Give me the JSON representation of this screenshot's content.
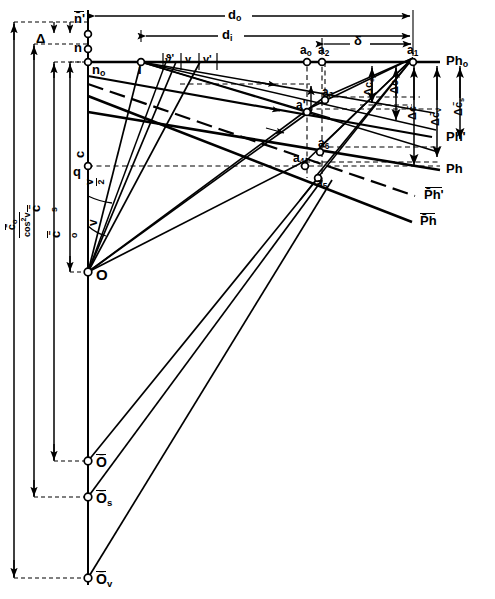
{
  "figure": {
    "type": "technical-geometry-diagram",
    "domain": "photogrammetry-optics-ray-construction",
    "background": "#ffffff",
    "ink": "#000000"
  },
  "points": [
    {
      "id": "n_bar_prime",
      "label": "n̄'",
      "x": 88,
      "y": 34
    },
    {
      "id": "n",
      "label": "n",
      "x": 88,
      "y": 49
    },
    {
      "id": "n0",
      "label": "n₀",
      "x": 88,
      "y": 62
    },
    {
      "id": "i",
      "label": "i",
      "x": 141,
      "y": 62
    },
    {
      "id": "q",
      "label": "q",
      "x": 88,
      "y": 166
    },
    {
      "id": "O",
      "label": "O",
      "x": 88,
      "y": 272
    },
    {
      "id": "O_bar",
      "label": "Ō",
      "x": 88,
      "y": 461
    },
    {
      "id": "O_bar_s",
      "label": "Ō_s",
      "x": 88,
      "y": 497
    },
    {
      "id": "O_bar_v",
      "label": "Ō_v",
      "x": 88,
      "y": 578
    },
    {
      "id": "a0",
      "label": "a₀",
      "x": 307,
      "y": 58
    },
    {
      "id": "a2",
      "label": "a₂",
      "x": 322,
      "y": 58
    },
    {
      "id": "a1",
      "label": "a₁",
      "x": 413,
      "y": 58
    },
    {
      "id": "a3",
      "label": "a₃",
      "x": 325,
      "y": 97
    },
    {
      "id": "a_prime",
      "label": "a'",
      "x": 308,
      "y": 109
    },
    {
      "id": "a6",
      "label": "a₆",
      "x": 320,
      "y": 147
    },
    {
      "id": "a4",
      "label": "a₄",
      "x": 305,
      "y": 162
    },
    {
      "id": "a5",
      "label": "a₅",
      "x": 317,
      "y": 175
    }
  ],
  "labels": {
    "n_bar_prime": "n̄'",
    "n": "n",
    "n0": "n",
    "n0_sub": "o",
    "i": "i",
    "q": "q",
    "O": "O",
    "O_bar": "Ō",
    "O_bar_s": "Ō",
    "O_bar_s_sub": "s",
    "O_bar_v": "Ō",
    "O_bar_v_sub": "v",
    "delta_gap": "Δ",
    "a0": "a",
    "a0_sub": "o",
    "a1": "a",
    "a1_sub": "1",
    "a2": "a",
    "a2_sub": "2",
    "a3": "a",
    "a3_sub": "3",
    "a4": "a",
    "a4_sub": "4",
    "a5": "a",
    "a5_sub": "5",
    "a6": "a",
    "a6_sub": "6",
    "a_prime": "a'"
  },
  "dimensions_top": [
    {
      "id": "d_o",
      "label": "d",
      "sub": "o",
      "x": 232,
      "y": 22,
      "from": 88,
      "to": 413,
      "row_y": 16
    },
    {
      "id": "d_i",
      "label": "d",
      "sub": "i",
      "x": 226,
      "y": 40,
      "from": 141,
      "to": 413,
      "row_y": 36
    },
    {
      "id": "delta",
      "label": "δ",
      "x": 358,
      "y": 44,
      "from": 322,
      "to": 413,
      "row_y": 44
    }
  ],
  "dimensions_left": [
    {
      "id": "c",
      "label": "c",
      "x": 75,
      "y": 152
    },
    {
      "id": "c_bar_s",
      "label": "c̄",
      "sub": "s",
      "x": 31,
      "y": 205
    },
    {
      "id": "c_bar_o",
      "label": "c̄",
      "sub": "o",
      "x": 52,
      "y": 231
    },
    {
      "id": "c_bar_o_over_cos2v",
      "num": "c̄",
      "num_sub": "o",
      "den": "cos",
      "den_sup": "2",
      "den_var": "v",
      "x": 6,
      "y": 252
    }
  ],
  "dimensions_right": [
    {
      "id": "dc_s",
      "label": "Δc",
      "sub": "s",
      "x": 365,
      "y": 88
    },
    {
      "id": "dc",
      "label": "Δc",
      "x": 392,
      "y": 88
    },
    {
      "id": "dc_bar",
      "label": "Δc̄",
      "x": 408,
      "y": 112
    },
    {
      "id": "dc_bar_v",
      "label": "Δc̄",
      "sub": "v",
      "x": 432,
      "y": 117
    },
    {
      "id": "dc_bar_s",
      "label": "Δc̄",
      "sub": "s",
      "x": 454,
      "y": 107
    }
  ],
  "angles": [
    {
      "id": "theta_prime",
      "label": "ϑ'",
      "x": 170,
      "y": 61
    },
    {
      "id": "v_1",
      "label": "v",
      "x": 190,
      "y": 62
    },
    {
      "id": "v_prime",
      "label": "v'",
      "x": 208,
      "y": 62
    },
    {
      "id": "v_over_2",
      "num": "v",
      "den": "2",
      "x": 86,
      "y": 195
    },
    {
      "id": "v_lower",
      "label": "v",
      "x": 89,
      "y": 232
    }
  ],
  "plane_labels": [
    {
      "id": "Ph_o",
      "label": "Ph",
      "sub": "o",
      "x": 449,
      "y": 60
    },
    {
      "id": "Ph_prime",
      "label": "Ph'",
      "x": 449,
      "y": 136
    },
    {
      "id": "Ph",
      "label": "Ph",
      "x": 449,
      "y": 168
    },
    {
      "id": "Ph_bar_prime",
      "label": "P̄h'",
      "x": 428,
      "y": 195
    },
    {
      "id": "Ph_bar",
      "label": "P̄h",
      "x": 424,
      "y": 221
    }
  ],
  "lines": {
    "axis_vertical_x": 88,
    "horizon_y": 62,
    "rulers_x": [
      14,
      34,
      54,
      70
    ],
    "ruler_bottom_y": 578
  }
}
